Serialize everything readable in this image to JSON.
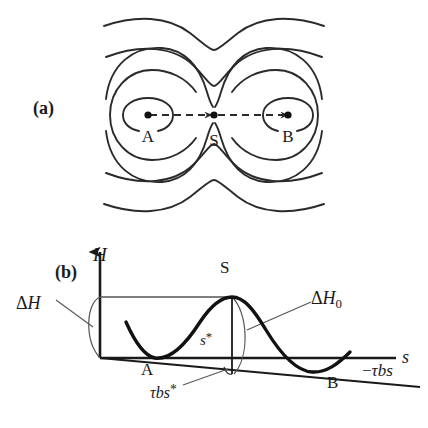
{
  "figure": {
    "background_color": "#ffffff",
    "line_color": "#2a2a2a",
    "curve_color": "#111111"
  },
  "panels": [
    {
      "id": "a",
      "label": "(a)",
      "type": "contour-map",
      "description": "Contour map of an energy landscape with two minima A and B separated by a saddle point S; a dashed arrowed path runs A to S to B.",
      "points": [
        {
          "name": "minimum-a",
          "label": "A",
          "x": 148,
          "y": 115
        },
        {
          "name": "saddle-s",
          "label": "S",
          "x": 214,
          "y": 115
        },
        {
          "name": "minimum-b",
          "label": "B",
          "x": 287,
          "y": 115
        }
      ],
      "path": {
        "name": "transition-path",
        "style": "dashed",
        "arrowheads": 2,
        "from": "A",
        "via": "S",
        "to": "B"
      }
    },
    {
      "id": "b",
      "label": "(b)",
      "type": "energy-profile",
      "axes": {
        "y_label": "H",
        "x_label": "s",
        "origin": {
          "x": 100,
          "y": 358
        },
        "y_top": {
          "x": 100,
          "y": 243
        },
        "x_right": {
          "x": 398,
          "y": 358
        }
      },
      "annotations": [
        {
          "name": "delta-h-label",
          "text": "ΔH",
          "x": 18,
          "y": 297
        },
        {
          "name": "delta-h0-label",
          "text": "ΔH₀",
          "x": 313,
          "y": 300
        },
        {
          "name": "saddle-label",
          "text": "S",
          "x": 226,
          "y": 268
        },
        {
          "name": "minimum-a-label",
          "text": "A",
          "x": 144,
          "y": 365
        },
        {
          "name": "minimum-b-label",
          "text": "B",
          "x": 330,
          "y": 377
        },
        {
          "name": "s-star-label",
          "text": "s*",
          "x": 204,
          "y": 335
        },
        {
          "name": "tau-b-s-star-label",
          "text": "τbs*",
          "x": 160,
          "y": 388
        },
        {
          "name": "tilt-line-label",
          "text": "−τbs",
          "x": 364,
          "y": 367
        }
      ],
      "curve": {
        "name": "energy-profile-curve",
        "minimum_a": {
          "x": 155,
          "y": 358
        },
        "maximum_s": {
          "x": 232,
          "y": 297
        },
        "minimum_b": {
          "x": 330,
          "y": 372
        }
      },
      "tilt_line": {
        "name": "tilt-baseline",
        "expression": "−τbs",
        "from": {
          "x": 100,
          "y": 358
        },
        "to": {
          "x": 420,
          "y": 386
        }
      }
    }
  ]
}
